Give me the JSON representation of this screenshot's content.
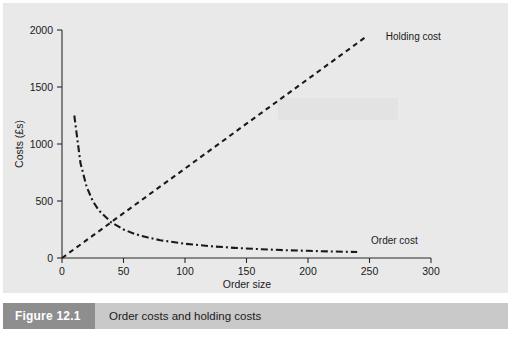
{
  "figure": {
    "number_label": "Figure 12.1",
    "caption": "Order costs and holding costs",
    "number_bg": "#8e8e8e",
    "caption_bg": "#c9c9c9"
  },
  "chart_data": {
    "type": "line",
    "title": "",
    "xlabel": "Order size",
    "ylabel": "Costs (£s)",
    "xlim": [
      0,
      300
    ],
    "ylim": [
      0,
      2000
    ],
    "xticks": [
      0,
      50,
      100,
      150,
      200,
      250,
      300
    ],
    "xticklabels": [
      "0",
      "50",
      "100",
      "150",
      "200",
      "250",
      "300"
    ],
    "yticks": [
      0,
      500,
      1000,
      1500,
      2000
    ],
    "yticklabels": [
      "0",
      "500",
      "1000",
      "1500",
      "2000"
    ],
    "grid": false,
    "legend_position": "inline-annotations",
    "plot_background": "#e9e9e9",
    "line_color": "#1a1a1a",
    "series": [
      {
        "name": "Holding cost",
        "label": "Holding cost",
        "style": "dashed",
        "relationship": "linear, cost = 7.85 x",
        "x": [
          0,
          25,
          50,
          75,
          100,
          125,
          150,
          175,
          200,
          225,
          248
        ],
        "values": [
          0,
          196,
          393,
          589,
          785,
          981,
          1178,
          1374,
          1570,
          1766,
          1947
        ]
      },
      {
        "name": "Order cost",
        "label": "Order cost",
        "style": "dash-dot",
        "relationship": "hyperbolic, cost = 12500 / x",
        "x": [
          10,
          15,
          20,
          25,
          30,
          40,
          50,
          60,
          70,
          80,
          100,
          120,
          140,
          160,
          180,
          200,
          220,
          240
        ],
        "values": [
          1250,
          833,
          625,
          500,
          417,
          313,
          250,
          208,
          179,
          156,
          125,
          104,
          89,
          78,
          69,
          63,
          57,
          52
        ]
      }
    ],
    "annotations": [
      {
        "text": "Holding cost",
        "x": 260,
        "y": 1950
      },
      {
        "text": "Order cost",
        "x": 248,
        "y": 160
      }
    ]
  }
}
